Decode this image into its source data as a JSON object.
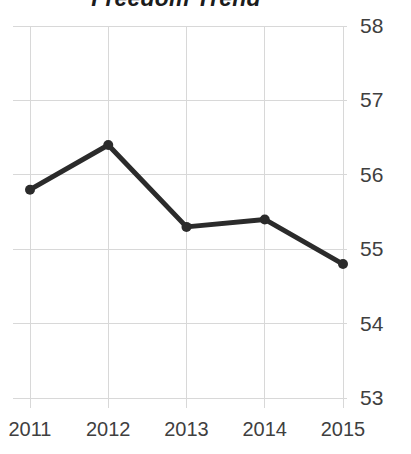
{
  "chart_data": {
    "type": "line",
    "title": "Freedom Trend",
    "xlabel": "",
    "ylabel": "",
    "categories": [
      "2011",
      "2012",
      "2013",
      "2014",
      "2015"
    ],
    "values": [
      55.8,
      56.4,
      55.3,
      55.4,
      54.8
    ],
    "series": [
      {
        "name": "Freedom Trend",
        "values": [
          55.8,
          56.4,
          55.3,
          55.4,
          54.8
        ]
      }
    ],
    "x_tick_labels": [
      "2011",
      "2012",
      "2013",
      "2014",
      "2015"
    ],
    "y_tick_labels": [
      "58",
      "57",
      "56",
      "55",
      "54",
      "53"
    ],
    "y_ticks": [
      58,
      57,
      56,
      55,
      54,
      53
    ],
    "ylim": [
      53,
      58
    ],
    "grid": true,
    "grid_axis": "both",
    "legend": false,
    "legend_position": "none",
    "y_axis_position": "right",
    "colors": {
      "line": "#2b2b2b",
      "marker": "#2b2b2b",
      "grid": "#d8d8d8",
      "tick_label": "#3f3f3f",
      "title": "#1c1c1c",
      "background": "#ffffff"
    },
    "style": {
      "line_width_px": 5,
      "marker_size_px": 10,
      "marker_shape": "circle"
    }
  }
}
